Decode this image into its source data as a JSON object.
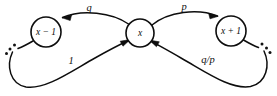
{
  "diagram": {
    "type": "state-transition-diagram",
    "title": "",
    "background_color": "#ffffff",
    "stroke_color": "#0d0d0d",
    "nodes": [
      {
        "id": "state-minus",
        "label": "x − 1",
        "cx": 46,
        "cy": 32,
        "r": 15
      },
      {
        "id": "state-current",
        "label": "x",
        "cx": 140,
        "cy": 33,
        "r": 14
      },
      {
        "id": "state-plus",
        "label": "x + 1",
        "cx": 231,
        "cy": 31,
        "r": 15
      }
    ],
    "edges": [
      {
        "id": "edge-x-to-minus",
        "label": "q",
        "from": "state-current",
        "to": "state-minus",
        "label_x": 89,
        "label_y": 9
      },
      {
        "id": "edge-x-to-plus",
        "label": "p",
        "from": "state-current",
        "to": "state-plus",
        "label_x": 184,
        "label_y": 8
      },
      {
        "id": "edge-left-loop-to-x",
        "label": "1",
        "from": "left-boundary",
        "to": "state-current",
        "label_x": 71,
        "label_y": 62
      },
      {
        "id": "edge-right-loop-to-x",
        "label": "q/p",
        "from": "right-boundary",
        "to": "state-current",
        "label_x": 208,
        "label_y": 61
      }
    ],
    "ellipses": [
      {
        "id": "ellipsis-left",
        "dots": 3
      },
      {
        "id": "ellipsis-right",
        "dots": 3
      }
    ]
  }
}
